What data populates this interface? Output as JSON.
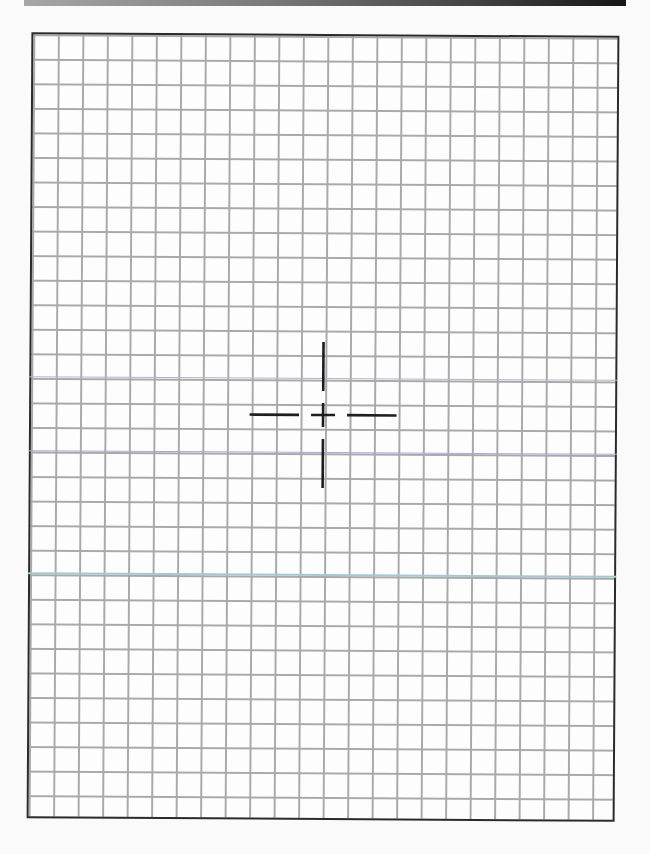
{
  "figure": {
    "type": "grid-paper-with-crosshair",
    "header_bar": {
      "gradient_start": "#a6a6a6",
      "gradient_end": "#161616"
    },
    "grid": {
      "columns": 24,
      "rows": 32,
      "line_color": "#a9a9a9",
      "border_color": "#2b2b2b",
      "background": "#fdfdfd"
    },
    "tinted_lines": [
      {
        "row": 14,
        "color": "#b3b3cf"
      },
      {
        "row": 17,
        "color": "#a8a8d6"
      },
      {
        "row": 22,
        "color": "#a8c8d0"
      }
    ],
    "crosshair": {
      "center_col": 12,
      "center_row": 16,
      "color": "#1e1e1e",
      "arm_length_cells": 3,
      "gap_cells": 1
    }
  }
}
